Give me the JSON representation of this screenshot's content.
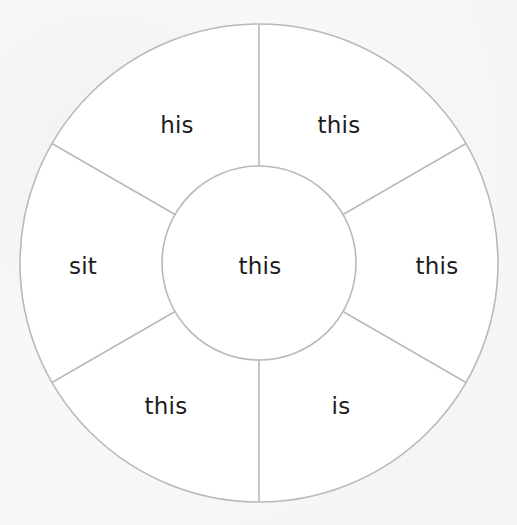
{
  "wheel": {
    "center": {
      "x": 259,
      "y": 263
    },
    "outer_radius": 239,
    "inner_radius": 97,
    "line_color": "#b9b9b9",
    "fill_color": "#ffffff",
    "text_color": "#1c1c1c",
    "center_word": "this",
    "segments": [
      {
        "position": "top-left",
        "word": "his"
      },
      {
        "position": "top-right",
        "word": "this"
      },
      {
        "position": "right",
        "word": "this"
      },
      {
        "position": "bottom-right",
        "word": "is"
      },
      {
        "position": "bottom-left",
        "word": "this"
      },
      {
        "position": "left",
        "word": "sit"
      }
    ]
  }
}
